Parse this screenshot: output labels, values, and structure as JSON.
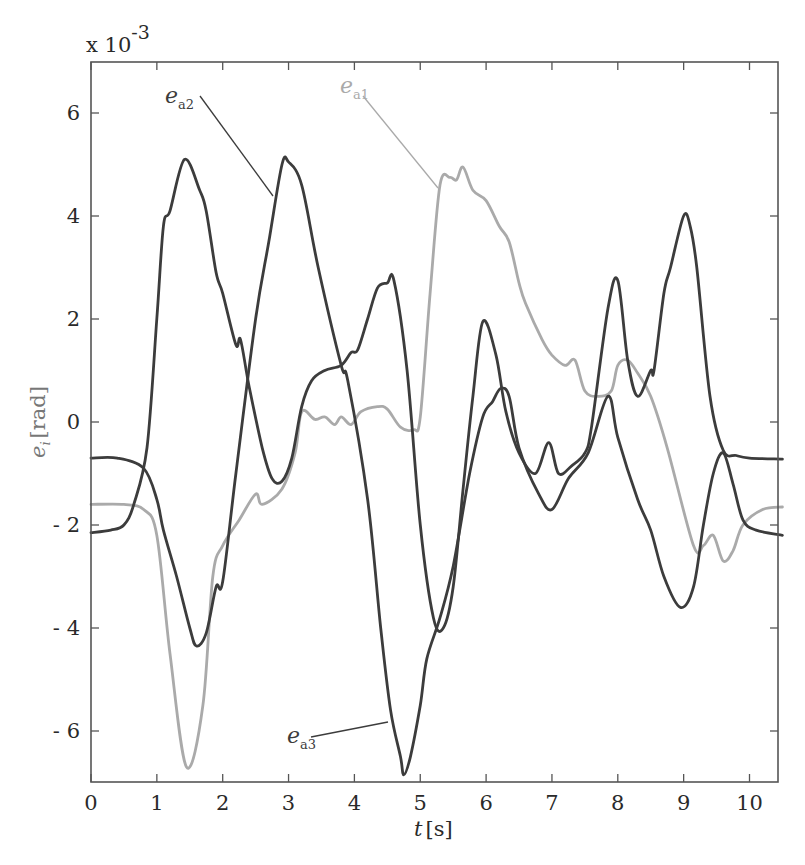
{
  "chart_data": {
    "type": "line",
    "title": "",
    "xlabel": "t [s]",
    "ylabel": "e_i [rad]",
    "y_multiplier": "x 10^-3",
    "xlim": [
      0,
      10.5
    ],
    "ylim": [
      -7,
      7
    ],
    "x_ticks": [
      0,
      1,
      2,
      3,
      4,
      5,
      6,
      7,
      8,
      9,
      10
    ],
    "y_ticks": [
      -6,
      -4,
      -2,
      0,
      2,
      4,
      6
    ],
    "grid": false,
    "legend": "inline annotations with leader lines",
    "series": [
      {
        "name": "e_a1",
        "color": "#aaaaaa",
        "points": [
          [
            0,
            -1.6
          ],
          [
            0.5,
            -1.6
          ],
          [
            0.8,
            -1.7
          ],
          [
            1.0,
            -2.2
          ],
          [
            1.2,
            -4.5
          ],
          [
            1.45,
            -6.7
          ],
          [
            1.7,
            -5.5
          ],
          [
            1.85,
            -3.0
          ],
          [
            2.0,
            -2.4
          ],
          [
            2.25,
            -1.9
          ],
          [
            2.5,
            -1.4
          ],
          [
            2.6,
            -1.6
          ],
          [
            2.9,
            -1.3
          ],
          [
            3.1,
            -0.6
          ],
          [
            3.2,
            0.2
          ],
          [
            3.4,
            0.05
          ],
          [
            3.55,
            0.1
          ],
          [
            3.7,
            -0.05
          ],
          [
            3.8,
            0.1
          ],
          [
            3.95,
            -0.05
          ],
          [
            4.1,
            0.2
          ],
          [
            4.35,
            0.3
          ],
          [
            4.5,
            0.25
          ],
          [
            4.7,
            -0.1
          ],
          [
            4.9,
            -0.15
          ],
          [
            5.0,
            0.1
          ],
          [
            5.15,
            2.5
          ],
          [
            5.3,
            4.6
          ],
          [
            5.45,
            4.75
          ],
          [
            5.55,
            4.7
          ],
          [
            5.65,
            4.95
          ],
          [
            5.8,
            4.5
          ],
          [
            6.0,
            4.3
          ],
          [
            6.2,
            3.8
          ],
          [
            6.35,
            3.5
          ],
          [
            6.5,
            2.7
          ],
          [
            6.6,
            2.3
          ],
          [
            6.85,
            1.6
          ],
          [
            7.0,
            1.3
          ],
          [
            7.2,
            1.1
          ],
          [
            7.35,
            1.2
          ],
          [
            7.5,
            0.6
          ],
          [
            7.7,
            0.5
          ],
          [
            7.9,
            0.6
          ],
          [
            8.0,
            1.1
          ],
          [
            8.15,
            1.2
          ],
          [
            8.3,
            0.95
          ],
          [
            8.5,
            0.5
          ],
          [
            8.75,
            -0.5
          ],
          [
            9.15,
            -2.4
          ],
          [
            9.3,
            -2.4
          ],
          [
            9.45,
            -2.2
          ],
          [
            9.6,
            -2.7
          ],
          [
            9.75,
            -2.5
          ],
          [
            9.9,
            -2.0
          ],
          [
            10.2,
            -1.7
          ],
          [
            10.5,
            -1.65
          ]
        ]
      },
      {
        "name": "e_a2",
        "color": "#3c3c3c",
        "points": [
          [
            0,
            -2.15
          ],
          [
            0.3,
            -2.1
          ],
          [
            0.5,
            -2.0
          ],
          [
            0.65,
            -1.6
          ],
          [
            0.85,
            -0.5
          ],
          [
            1.0,
            2.0
          ],
          [
            1.1,
            3.8
          ],
          [
            1.2,
            4.1
          ],
          [
            1.42,
            5.1
          ],
          [
            1.65,
            4.5
          ],
          [
            1.75,
            4.1
          ],
          [
            1.9,
            2.9
          ],
          [
            2.0,
            2.5
          ],
          [
            2.2,
            1.5
          ],
          [
            2.27,
            1.6
          ],
          [
            2.4,
            0.7
          ],
          [
            2.6,
            -0.5
          ],
          [
            2.75,
            -1.1
          ],
          [
            2.9,
            -1.15
          ],
          [
            3.05,
            -0.7
          ],
          [
            3.2,
            0.3
          ],
          [
            3.35,
            0.8
          ],
          [
            3.55,
            1.0
          ],
          [
            3.8,
            1.1
          ],
          [
            3.95,
            1.35
          ],
          [
            4.05,
            1.4
          ],
          [
            4.2,
            2.0
          ],
          [
            4.35,
            2.6
          ],
          [
            4.5,
            2.7
          ],
          [
            4.6,
            2.75
          ],
          [
            4.8,
            1.0
          ],
          [
            5.0,
            -2.0
          ],
          [
            5.2,
            -3.8
          ],
          [
            5.35,
            -4.0
          ],
          [
            5.5,
            -3.2
          ],
          [
            5.65,
            -1.3
          ],
          [
            5.8,
            0.5
          ],
          [
            5.95,
            1.95
          ],
          [
            6.15,
            1.3
          ],
          [
            6.3,
            0.2
          ],
          [
            6.5,
            -0.6
          ],
          [
            6.75,
            -1.0
          ],
          [
            6.95,
            -0.4
          ],
          [
            7.1,
            -1.0
          ],
          [
            7.3,
            -0.85
          ],
          [
            7.5,
            -0.6
          ],
          [
            7.6,
            -0.1
          ],
          [
            7.85,
            2.2
          ],
          [
            8.0,
            2.75
          ],
          [
            8.15,
            1.2
          ],
          [
            8.3,
            0.5
          ],
          [
            8.5,
            1.0
          ],
          [
            8.55,
            1.0
          ],
          [
            8.7,
            2.5
          ],
          [
            8.8,
            3.0
          ],
          [
            9.0,
            4.0
          ],
          [
            9.1,
            3.8
          ],
          [
            9.2,
            3.0
          ],
          [
            9.4,
            0.5
          ],
          [
            9.6,
            -0.55
          ],
          [
            9.8,
            -0.65
          ],
          [
            10.0,
            -0.7
          ],
          [
            10.5,
            -0.72
          ]
        ]
      },
      {
        "name": "e_a3",
        "color": "#3c3c3c",
        "points": [
          [
            0,
            -0.7
          ],
          [
            0.4,
            -0.7
          ],
          [
            0.8,
            -0.9
          ],
          [
            1.0,
            -1.5
          ],
          [
            1.1,
            -2.1
          ],
          [
            1.3,
            -3.0
          ],
          [
            1.5,
            -4.0
          ],
          [
            1.6,
            -4.35
          ],
          [
            1.75,
            -4.1
          ],
          [
            1.9,
            -3.2
          ],
          [
            2.0,
            -3.1
          ],
          [
            2.2,
            -1.0
          ],
          [
            2.5,
            2.0
          ],
          [
            2.7,
            3.5
          ],
          [
            2.9,
            5.0
          ],
          [
            3.0,
            5.05
          ],
          [
            3.2,
            4.6
          ],
          [
            3.45,
            3.0
          ],
          [
            3.8,
            1.1
          ],
          [
            3.9,
            0.8
          ],
          [
            4.2,
            -1.5
          ],
          [
            4.4,
            -4.0
          ],
          [
            4.55,
            -5.6
          ],
          [
            4.7,
            -6.5
          ],
          [
            4.75,
            -6.85
          ],
          [
            4.85,
            -6.5
          ],
          [
            5.0,
            -5.5
          ],
          [
            5.1,
            -4.6
          ],
          [
            5.3,
            -3.8
          ],
          [
            5.5,
            -2.8
          ],
          [
            5.75,
            -1.0
          ],
          [
            5.95,
            0.1
          ],
          [
            6.1,
            0.4
          ],
          [
            6.22,
            0.65
          ],
          [
            6.35,
            0.5
          ],
          [
            6.5,
            -0.5
          ],
          [
            6.8,
            -1.4
          ],
          [
            7.0,
            -1.7
          ],
          [
            7.25,
            -1.1
          ],
          [
            7.55,
            -0.6
          ],
          [
            7.85,
            0.5
          ],
          [
            8.0,
            -0.3
          ],
          [
            8.3,
            -1.5
          ],
          [
            8.5,
            -2.1
          ],
          [
            8.7,
            -3.0
          ],
          [
            8.95,
            -3.6
          ],
          [
            9.15,
            -3.2
          ],
          [
            9.3,
            -2.0
          ],
          [
            9.45,
            -1.0
          ],
          [
            9.6,
            -0.6
          ],
          [
            9.75,
            -1.2
          ],
          [
            9.9,
            -1.9
          ],
          [
            10.1,
            -2.1
          ],
          [
            10.5,
            -2.2
          ]
        ]
      }
    ],
    "annotations": [
      {
        "label": "e",
        "sub": "a2",
        "text_pos": [
          165,
          103
        ],
        "line_from": [
          200,
          96
        ],
        "line_to": [
          273,
          196
        ],
        "color": "#3c3c3c"
      },
      {
        "label": "e",
        "sub": "a1",
        "text_pos": [
          340,
          93
        ],
        "line_from": [
          363,
          96
        ],
        "line_to": [
          438,
          188
        ],
        "color": "#aaaaaa"
      },
      {
        "label": "e",
        "sub": "a3",
        "text_pos": [
          287,
          743
        ],
        "line_from": [
          311,
          737
        ],
        "line_to": [
          388,
          722
        ],
        "color": "#3c3c3c"
      }
    ]
  },
  "labels": {
    "multiplier_base": "x 10",
    "multiplier_exp": "-3",
    "xlabel_var": "t",
    "xlabel_unit": "[s]",
    "ylabel_var": "e",
    "ylabel_sub": "i",
    "ylabel_unit": "[rad]"
  }
}
